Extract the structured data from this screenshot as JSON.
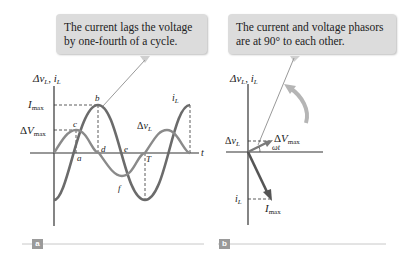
{
  "panel_a": {
    "callout": "The current lags the voltage by one-fourth of a cycle.",
    "axis_y_label": "Δv_L, i_L",
    "axis_x_label": "t",
    "labels": {
      "i_max": "I_max",
      "v_max": "ΔV_max",
      "points": [
        "a",
        "b",
        "c",
        "d",
        "e",
        "f",
        "T"
      ],
      "curve_current": "i_L",
      "curve_voltage": "Δv_L"
    },
    "tag": "a"
  },
  "panel_b": {
    "callout": "The current and voltage phasors are at 90° to each other.",
    "axis_y_label": "Δv_L, i_L",
    "labels": {
      "voltage_proj": "Δv_L",
      "voltage_phasor": "ΔV_max",
      "angle": "ωt",
      "current_proj": "i_L",
      "current_phasor": "I_max"
    },
    "tag": "b"
  },
  "colors": {
    "curve": "#6b6b6b",
    "axis": "#333333",
    "callout_bg": "#dcdcdc",
    "tag_bg": "#9a9a9a",
    "rule": "#c8c8c8"
  }
}
